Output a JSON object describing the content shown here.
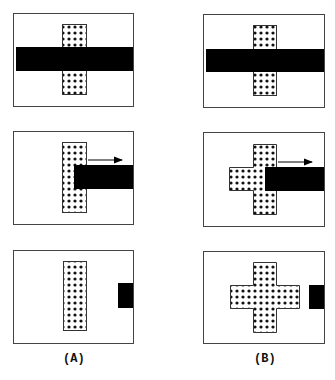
{
  "figure": {
    "columns": [
      {
        "label": "(A)",
        "description": "Dotted vertical bar only; horizontal black bar slides right revealing bar"
      },
      {
        "label": "(B)",
        "description": "Dotted cross shape revealed as black bar slides right"
      }
    ],
    "rows": 3,
    "colors": {
      "frame": "#444444",
      "occluder": "#000000",
      "dot": "#111111",
      "dot_background": "#ffffff"
    },
    "arrow_direction": "right"
  }
}
